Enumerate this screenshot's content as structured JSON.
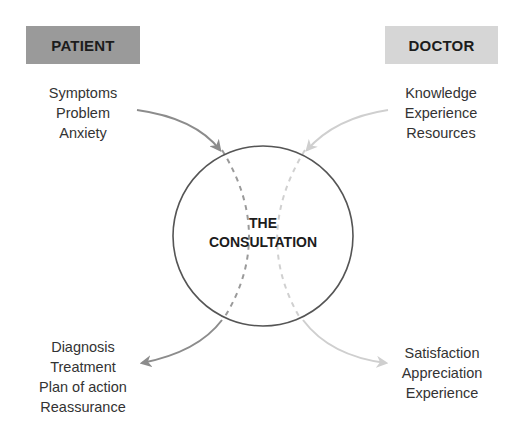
{
  "patient": {
    "title": "PATIENT",
    "color": "#9a9a9a",
    "inputs": [
      "Symptoms",
      "Problem",
      "Anxiety"
    ],
    "outputs": [
      "Diagnosis",
      "Treatment",
      "Plan of action",
      "Reassurance"
    ]
  },
  "doctor": {
    "title": "DOCTOR",
    "color": "#d6d6d6",
    "inputs": [
      "Knowledge",
      "Experience",
      "Resources"
    ],
    "outputs": [
      "Satisfaction",
      "Appreciation",
      "Experience"
    ]
  },
  "center": {
    "line1": "THE",
    "line2": "CONSULTATION"
  },
  "colors": {
    "patient_arrow": "#8c8c8c",
    "doctor_arrow": "#cfcfcf",
    "circle_stroke": "#555555"
  }
}
